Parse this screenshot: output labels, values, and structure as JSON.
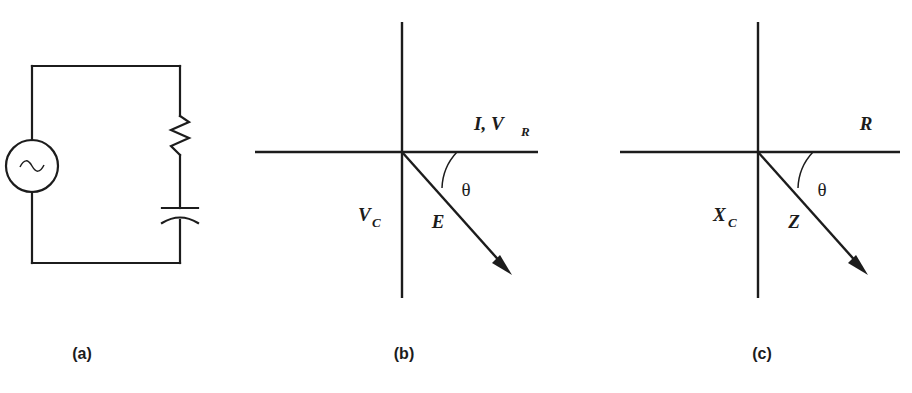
{
  "figure": {
    "panels": [
      {
        "id": "a",
        "caption": "(a)",
        "type": "circuit",
        "components": [
          {
            "name": "ac-source",
            "symbol": "~",
            "label": ""
          },
          {
            "name": "resistor",
            "symbol": "zigzag",
            "label": ""
          },
          {
            "name": "capacitor",
            "symbol": "parallel-plates",
            "label": ""
          }
        ]
      },
      {
        "id": "b",
        "caption": "(b)",
        "type": "phasor-diagram",
        "horizontal_axis_label": "I, V",
        "horizontal_axis_label_sub": "R",
        "vertical_axis_label": "V",
        "vertical_axis_label_sub": "C",
        "vector_label": "E",
        "angle_label": "θ"
      },
      {
        "id": "c",
        "caption": "(c)",
        "type": "impedance-diagram",
        "horizontal_axis_label": "R",
        "horizontal_axis_label_sub": "",
        "vertical_axis_label": "X",
        "vertical_axis_label_sub": "C",
        "vector_label": "Z",
        "angle_label": "θ"
      }
    ],
    "colors": {
      "ink": "#1c1c1c",
      "background": "#ffffff"
    }
  }
}
